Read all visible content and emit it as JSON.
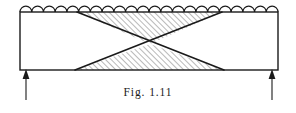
{
  "figure": {
    "caption": "Fig. 1.11",
    "caption_label": "Fig.",
    "caption_number": "1.11",
    "diagram_type": "structural-beam-loading-diagram",
    "colors": {
      "ink": "#1a1a1a",
      "background": "#ffffff",
      "hatch": "#555555"
    },
    "beam": {
      "name": "beam-body",
      "x": 20,
      "y": 12,
      "width": 258,
      "height": 58,
      "stroke_width": 1.4
    },
    "distributed_load": {
      "name": "uniformly-distributed-load",
      "symbol": "semicircular-arc-row",
      "arc_count": 22,
      "arc_radius": 5.9,
      "baseline_y": 12
    },
    "truss": {
      "name": "x-bracing-bowtie",
      "crossing_point": {
        "x": 150,
        "y": 44
      },
      "top_left_x": 77,
      "top_right_x": 222,
      "bottom_left_x": 75,
      "bottom_right_x": 224,
      "hatch_angle_deg": 45,
      "hatch_spacing": 4
    },
    "supports": [
      {
        "name": "left-support-reaction",
        "type": "upward-reaction-arrow",
        "x": 26,
        "tip_y": 70,
        "tail_y": 100
      },
      {
        "name": "right-support-reaction",
        "type": "upward-reaction-arrow",
        "x": 272,
        "tip_y": 70,
        "tail_y": 100
      }
    ]
  }
}
